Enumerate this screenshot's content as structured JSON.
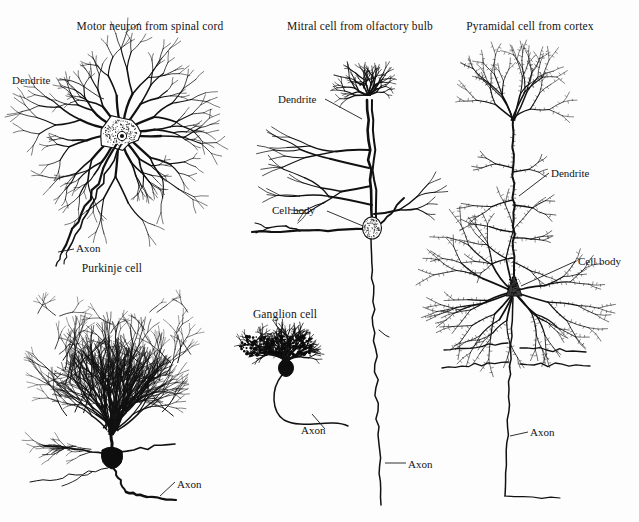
{
  "figure": {
    "kind": "neuron-morphology-plate",
    "background_color": "#fdfdfd",
    "ink_color": "#111111",
    "width": 639,
    "height": 522
  },
  "panels": [
    {
      "id": "motor-neuron",
      "title": "Motor neuron from spinal cord",
      "title_x": 150,
      "title_y": 28,
      "annotations": [
        {
          "id": "motor-dendrite",
          "label": "Dendrite",
          "x": 12,
          "y": 82
        },
        {
          "id": "motor-axon",
          "label": "Axon",
          "x": 76,
          "y": 250
        }
      ]
    },
    {
      "id": "mitral-cell",
      "title": "Mitral cell from olfactory bulb",
      "title_x": 360,
      "title_y": 28,
      "annotations": [
        {
          "id": "mitral-dendrite",
          "label": "Dendrite",
          "x": 278,
          "y": 101
        },
        {
          "id": "mitral-cell-body",
          "label": "Cell body",
          "x": 272,
          "y": 212
        },
        {
          "id": "mitral-axon",
          "label": "Axon",
          "x": 408,
          "y": 466
        }
      ]
    },
    {
      "id": "pyramidal-cell",
      "title": "Pyramidal cell from cortex",
      "title_x": 530,
      "title_y": 28,
      "annotations": [
        {
          "id": "pyramidal-dendrite",
          "label": "Dendrite",
          "x": 551,
          "y": 175
        },
        {
          "id": "pyramidal-cell-body",
          "label": "Cell body",
          "x": 578,
          "y": 263
        },
        {
          "id": "pyramidal-axon",
          "label": "Axon",
          "x": 530,
          "y": 434
        }
      ]
    },
    {
      "id": "purkinje-cell",
      "title": "Purkinje cell",
      "title_x": 112,
      "title_y": 270,
      "annotations": [
        {
          "id": "purkinje-axon",
          "label": "Axon",
          "x": 177,
          "y": 486
        }
      ]
    },
    {
      "id": "ganglion-cell",
      "title": "Ganglion cell",
      "title_x": 285,
      "title_y": 316,
      "annotations": [
        {
          "id": "ganglion-axon",
          "label": "Axon",
          "x": 301,
          "y": 432
        }
      ]
    }
  ]
}
